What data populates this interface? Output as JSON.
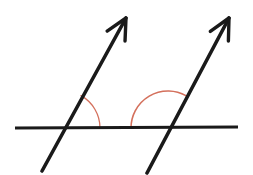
{
  "canvas": {
    "width": 253,
    "height": 175,
    "background_color": "#ffffff",
    "title": "Two parallel rays crossing a transversal line with marked angles"
  },
  "colors": {
    "line_color": "#1a1a1a",
    "arc_color": "#d4705c",
    "background": "#ffffff"
  },
  "figure": {
    "type": "geometry-diagram",
    "horizontal_line": {
      "name": "transversal-horizontal-line",
      "x1": 15,
      "y1": 128,
      "x2": 238,
      "y2": 127,
      "stroke_width": 3.2
    },
    "rays": [
      {
        "name": "left-ray",
        "tail_x": 42,
        "tail_y": 171,
        "tip_x": 126,
        "tip_y": 18,
        "stroke_width": 3.6,
        "has_arrowhead": true,
        "arrowhead_position": "tip"
      },
      {
        "name": "right-ray",
        "tail_x": 147,
        "tail_y": 173,
        "tip_x": 229,
        "tip_y": 18,
        "stroke_width": 3.6,
        "has_arrowhead": true,
        "arrowhead_position": "tip"
      }
    ],
    "intersections": [
      {
        "name": "left-intersection-point",
        "x": 63,
        "y": 128
      },
      {
        "name": "right-intersection-point",
        "x": 168,
        "y": 128
      }
    ],
    "angle_arcs": [
      {
        "name": "left-angle-arc",
        "center_x": 63,
        "center_y": 128,
        "radius": 37,
        "start_angle_deg": 61,
        "end_angle_deg": 0,
        "measure_deg": 61,
        "kind": "acute",
        "side": "right-of-ray-above-line",
        "stroke_width": 1.3
      },
      {
        "name": "right-angle-arc",
        "center_x": 168,
        "center_y": 128,
        "radius": 37,
        "start_angle_deg": 180,
        "end_angle_deg": 61,
        "measure_deg": 119,
        "kind": "obtuse",
        "side": "left-of-ray-above-line",
        "stroke_width": 1.6
      }
    ]
  },
  "chart_data": {
    "type": "diagram",
    "annotations": [],
    "labels": []
  }
}
